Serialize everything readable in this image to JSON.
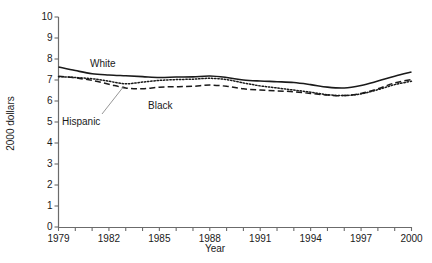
{
  "chart_data": {
    "type": "line",
    "title": "",
    "xlabel": "Year",
    "ylabel": "2000 dollars",
    "xlim": [
      1979,
      2000
    ],
    "ylim": [
      0,
      10
    ],
    "grid": false,
    "legend_position": "inline-annotations",
    "xticks": [
      1979,
      1980,
      1981,
      1982,
      1983,
      1984,
      1985,
      1986,
      1987,
      1988,
      1989,
      1990,
      1991,
      1992,
      1993,
      1994,
      1995,
      1996,
      1997,
      1998,
      1999,
      2000
    ],
    "xtick_labels": [
      "1979",
      "1982",
      "1985",
      "1988",
      "1991",
      "1994",
      "1997",
      "2000"
    ],
    "xtick_labeled_values": [
      1979,
      1982,
      1985,
      1988,
      1991,
      1994,
      1997,
      2000
    ],
    "yticks": [
      0,
      1,
      2,
      3,
      4,
      5,
      6,
      7,
      8,
      9,
      10
    ],
    "ytick_labels": [
      "0",
      "1",
      "2",
      "3",
      "4",
      "5",
      "6",
      "7",
      "8",
      "9",
      "10"
    ],
    "x": [
      1979,
      1980,
      1981,
      1982,
      1983,
      1984,
      1985,
      1986,
      1987,
      1988,
      1989,
      1990,
      1991,
      1992,
      1993,
      1994,
      1995,
      1996,
      1997,
      1998,
      1999,
      2000
    ],
    "series": [
      {
        "name": "White",
        "style": "solid",
        "color": "#1a1a1a",
        "values": [
          7.62,
          7.45,
          7.3,
          7.24,
          7.2,
          7.16,
          7.12,
          7.14,
          7.15,
          7.19,
          7.12,
          7.0,
          6.95,
          6.92,
          6.88,
          6.78,
          6.66,
          6.62,
          6.74,
          6.95,
          7.18,
          7.38
        ]
      },
      {
        "name": "Black",
        "style": "dashed",
        "color": "#1a1a1a",
        "values": [
          7.18,
          7.1,
          6.98,
          6.8,
          6.62,
          6.58,
          6.66,
          6.68,
          6.7,
          6.76,
          6.7,
          6.58,
          6.52,
          6.48,
          6.44,
          6.36,
          6.28,
          6.26,
          6.36,
          6.58,
          6.86,
          7.02
        ]
      },
      {
        "name": "Hispanic",
        "style": "dotted",
        "color": "#1a1a1a",
        "values": [
          7.16,
          7.12,
          7.06,
          6.94,
          6.82,
          6.9,
          6.98,
          7.02,
          7.04,
          7.08,
          7.02,
          6.86,
          6.72,
          6.62,
          6.52,
          6.42,
          6.3,
          6.26,
          6.34,
          6.54,
          6.78,
          6.94
        ]
      }
    ],
    "annotations": [
      {
        "text": "White",
        "series": "White"
      },
      {
        "text": "Black",
        "series": "Black"
      },
      {
        "text": "Hispanic",
        "series": "Hispanic",
        "has_leader_line": true
      }
    ]
  }
}
